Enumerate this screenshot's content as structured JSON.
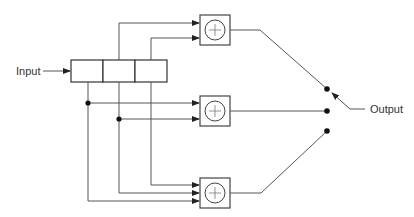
{
  "diagram": {
    "input_label": "Input",
    "output_label": "Output",
    "shift_register": {
      "cells": 3
    },
    "adders": [
      {
        "name": "adder-top",
        "symbol": "+",
        "inputs_from_cells": [
          2,
          3
        ]
      },
      {
        "name": "adder-middle",
        "symbol": "+",
        "inputs_from_cells": [
          1,
          2
        ]
      },
      {
        "name": "adder-bottom",
        "symbol": "+",
        "inputs_from_cells": [
          1,
          2,
          3
        ]
      }
    ],
    "commutator_switch": {
      "positions": 3,
      "selected": "top"
    }
  }
}
